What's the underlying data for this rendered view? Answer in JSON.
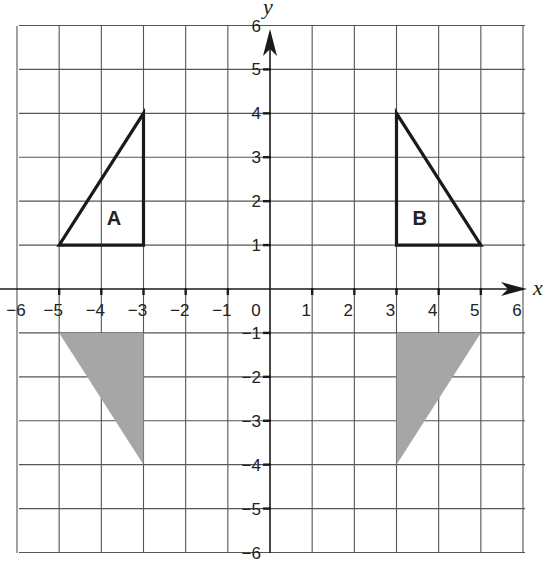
{
  "diagram": {
    "type": "coordinate-grid",
    "x_range": [
      -6,
      6
    ],
    "y_range": [
      -6,
      6
    ],
    "x_axis_label": "x",
    "y_axis_label": "y",
    "x_tick_labels": [
      "-6",
      "-5",
      "-4",
      "-3",
      "-2",
      "-1",
      "0",
      "1",
      "2",
      "3",
      "4",
      "5",
      "6"
    ],
    "y_tick_labels": [
      "6",
      "5",
      "4",
      "3",
      "2",
      "1",
      "-1",
      "-2",
      "-3",
      "-4",
      "-5",
      "-6"
    ],
    "colors": {
      "grid": "#555555",
      "axis": "#1a1a1a",
      "outline": "#1a1a1a",
      "shaded_fill": "#a6a6a6",
      "background": "#ffffff"
    },
    "shapes": [
      {
        "id": "A",
        "label": "A",
        "style": "outline",
        "vertices": [
          [
            -5,
            1
          ],
          [
            -3,
            1
          ],
          [
            -3,
            4
          ]
        ],
        "label_position": [
          -3.7,
          1.45
        ]
      },
      {
        "id": "B",
        "label": "B",
        "style": "outline",
        "vertices": [
          [
            3,
            1
          ],
          [
            5,
            1
          ],
          [
            3,
            4
          ]
        ],
        "label_position": [
          3.55,
          1.45
        ]
      },
      {
        "id": "shaded-left",
        "label": "",
        "style": "shaded",
        "vertices": [
          [
            -5,
            -1
          ],
          [
            -3,
            -1
          ],
          [
            -3,
            -4
          ]
        ]
      },
      {
        "id": "shaded-right",
        "label": "",
        "style": "shaded",
        "vertices": [
          [
            3,
            -1
          ],
          [
            5,
            -1
          ],
          [
            3,
            -4
          ]
        ]
      }
    ]
  }
}
